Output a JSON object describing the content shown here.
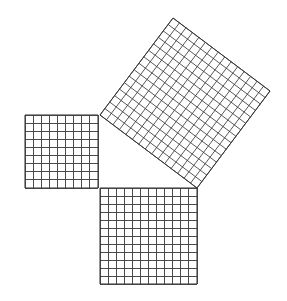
{
  "diagram": {
    "type": "pythagorean-theorem-grid-squares",
    "background": "#ffffff",
    "line_color": "#3a3a3a",
    "triangle": {
      "right_angle_vertex": [
        100,
        188
      ],
      "leg_a_vertex": [
        100,
        115
      ],
      "leg_b_vertex": [
        197,
        188
      ],
      "leg_a_units": 9,
      "leg_b_units": 12,
      "hypotenuse_units": 15
    },
    "squares": [
      {
        "name": "square-leg-a",
        "units": 9,
        "origin": [
          25,
          115
        ],
        "u": [
          8.111,
          0
        ],
        "v": [
          0,
          8.111
        ]
      },
      {
        "name": "square-leg-b",
        "units": 12,
        "origin": [
          100,
          188
        ],
        "u": [
          8.083,
          0
        ],
        "v": [
          0,
          8.0
        ]
      },
      {
        "name": "square-hypotenuse",
        "units": 15,
        "origin": [
          100,
          115
        ],
        "u": [
          6.467,
          4.867
        ],
        "v": [
          4.867,
          -6.467
        ]
      }
    ]
  }
}
